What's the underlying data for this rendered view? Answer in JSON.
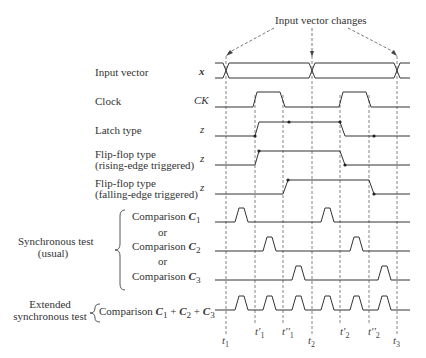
{
  "title": "Input vector changes",
  "signals": [
    {
      "label": "Input vector",
      "symbol": "x"
    },
    {
      "label": "Clock",
      "symbol": "CK"
    },
    {
      "label": "Latch type",
      "symbol": "z"
    },
    {
      "label": "Flip-flop type",
      "label2": "(rising-edge triggered)",
      "symbol": "z"
    },
    {
      "label": "Flip-flop type",
      "label2": "(falling-edge triggered)",
      "symbol": "z"
    }
  ],
  "groups": {
    "sync_usual": {
      "line1": "Synchronous test",
      "line2": "(usual)"
    },
    "extended": {
      "line1": "Extended",
      "line2": "synchronous test"
    }
  },
  "comparisons": {
    "c1": "Comparison C1",
    "or1": "or",
    "c2": "Comparison C2",
    "or2": "or",
    "c3": "Comparison C3",
    "all": "Comparison C1 + C2 + C3"
  },
  "time_labels": [
    "t1",
    "t'1",
    "t''1",
    "t2",
    "t'2",
    "t''2",
    "t3"
  ],
  "colors": {
    "line": "#333333",
    "dashed": "#555555"
  }
}
